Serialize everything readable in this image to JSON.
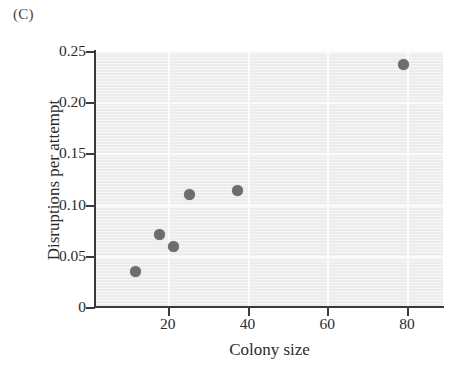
{
  "panel": {
    "letter": "(C)"
  },
  "chart_data": {
    "type": "scatter",
    "title": "",
    "panel_label": "(C)",
    "xlabel": "Colony size",
    "ylabel": "Disruptions per attempt",
    "xlim": [
      2,
      89
    ],
    "ylim": [
      0,
      0.25
    ],
    "xticks": [
      20,
      40,
      60,
      80
    ],
    "xticklabels": [
      "20",
      "40",
      "60",
      "80"
    ],
    "yticks": [
      0,
      0.05,
      0.1,
      0.15,
      0.2,
      0.25
    ],
    "yticklabels": [
      "0",
      "0.05",
      "0.10",
      "0.15",
      "0.20",
      "0.25"
    ],
    "grid": true,
    "grid_color": "#fbfbfb",
    "plot_background": "#ececed",
    "legend": null,
    "marker_color": "#6d6d6d",
    "marker_shape": "circle",
    "x": [
      12,
      18,
      21.5,
      25.5,
      37.5,
      79
    ],
    "y": [
      0.035,
      0.071,
      0.059,
      0.11,
      0.114,
      0.237
    ],
    "points": [
      {
        "x": 12,
        "y": 0.035
      },
      {
        "x": 18,
        "y": 0.071
      },
      {
        "x": 21.5,
        "y": 0.059
      },
      {
        "x": 25.5,
        "y": 0.11
      },
      {
        "x": 37.5,
        "y": 0.114
      },
      {
        "x": 79,
        "y": 0.237
      }
    ]
  }
}
